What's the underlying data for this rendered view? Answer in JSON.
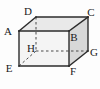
{
  "diagram": {
    "shape": "cuboid-wireframe",
    "labels": {
      "A": "A",
      "B": "B",
      "C": "C",
      "D": "D",
      "E": "E",
      "F": "F",
      "G": "G",
      "H": "H"
    },
    "colors": {
      "edge": "#2b2b2b",
      "hidden_edge": "#4a4a4a",
      "top_face": "#e9e9e9",
      "right_face": "#d8d8d8",
      "front_face": "#f4f4f4",
      "background": "#fdfdfd",
      "label_text": "#1a1a1a"
    }
  }
}
